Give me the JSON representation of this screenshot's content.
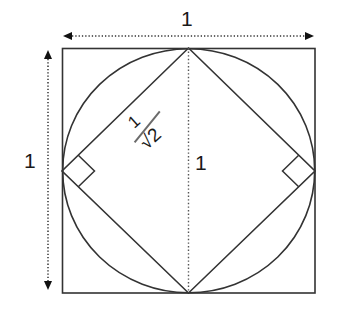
{
  "figure": {
    "type": "geometric-diagram",
    "background_color": "#ffffff",
    "stroke_color": "#333333",
    "dimension_color": "#1a1a1a",
    "fraction_bar_color": "#6b6b6b",
    "square": {
      "name": "outer-square",
      "left": 62,
      "top": 48,
      "right": 315,
      "bottom": 293,
      "side_label": "1",
      "stroke_width": 1.6
    },
    "circle": {
      "name": "inscribed-circle",
      "cx": 188.5,
      "cy": 170.5,
      "r": 126,
      "stroke_width": 1.6
    },
    "diamond": {
      "name": "inscribed-rotated-square",
      "top": [
        188.5,
        48
      ],
      "right": [
        315,
        171
      ],
      "bottom": [
        188.5,
        293
      ],
      "left": [
        62,
        171
      ],
      "side_label": "1/√2",
      "stroke_width": 1.6
    },
    "right_angle_markers": [
      {
        "name": "right-angle-marker-left",
        "vertex_x": 62,
        "vertex_y": 171,
        "size": 23
      },
      {
        "name": "right-angle-marker-right",
        "vertex_x": 315,
        "vertex_y": 171,
        "size": 23
      }
    ],
    "vertical_axis_line": {
      "name": "diamond-vertical-diagonal",
      "x": 188.5,
      "y1": 48,
      "y2": 293,
      "style": "dotted",
      "label": "1"
    }
  },
  "dimensions": {
    "top": {
      "label": "1",
      "axis": "horizontal",
      "y": 36,
      "x1": 62,
      "x2": 315,
      "style": "dotted-double-arrow"
    },
    "left": {
      "label": "1",
      "axis": "vertical",
      "x": 48,
      "y1": 48,
      "y2": 291,
      "style": "dotted-double-arrow"
    },
    "center": {
      "label": "1",
      "description": "vertical diagonal of rotated square"
    },
    "diagonal": {
      "numerator": "1",
      "denominator": "√2",
      "description": "side length of inscribed rotated square"
    }
  }
}
